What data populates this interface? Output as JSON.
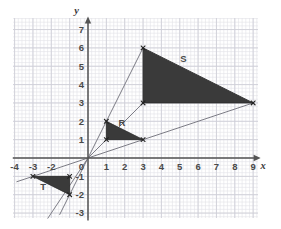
{
  "figure": {
    "background_color": "#ffffff",
    "grid_minor_color": "#e3e3e8",
    "grid_major_color": "#cfcfd8",
    "axis_color": "#555555",
    "ray_color": "#6e6e78",
    "shape_fill": "#3a3a3a",
    "shape_stroke": "#2b2b2b",
    "label_color": "#4a4a4a"
  },
  "grid": {
    "origin_px": {
      "x": 88.0,
      "y": 158.0
    },
    "unit_px": 18.35,
    "minor_per_unit": 5,
    "extent_px": {
      "left": 13,
      "top": 18,
      "right": 258,
      "bottom": 218
    },
    "show_minor": true,
    "show_major": true
  },
  "axes": {
    "x_axis": {
      "name": "x",
      "name_pos": {
        "x": 9.55,
        "y": -0.62
      },
      "ticks": [
        -4,
        -3,
        -2,
        1,
        2,
        3,
        4,
        5,
        6,
        7,
        8,
        9
      ],
      "tick_labels": [
        "-4",
        "-3",
        "-2",
        "1",
        "2",
        "3",
        "4",
        "5",
        "6",
        "7",
        "8",
        "9"
      ],
      "range": [
        -4.1,
        9.3
      ]
    },
    "y_axis": {
      "name": "y",
      "name_pos": {
        "x": -0.62,
        "y": 7.85
      },
      "ticks": [
        -3,
        -2,
        -1,
        1,
        2,
        3,
        4,
        5,
        6,
        7
      ],
      "tick_labels": [
        "-3",
        "-2",
        "-1",
        "1",
        "2",
        "3",
        "4",
        "5",
        "6",
        "7"
      ],
      "range": [
        -3.4,
        7.6
      ]
    },
    "origin_label": "0"
  },
  "chart_data": {
    "type": "diagram",
    "xlabel": "x",
    "ylabel": "y",
    "xlim": [
      -4.1,
      9.3
    ],
    "ylim": [
      -3.4,
      7.6
    ],
    "grid": true,
    "shapes": [
      {
        "name": "R",
        "label": "R",
        "label_pos": {
          "x": 1.85,
          "y": 1.72
        },
        "vertices": [
          {
            "x": 1,
            "y": 2
          },
          {
            "x": 1,
            "y": 1
          },
          {
            "x": 3,
            "y": 1
          }
        ],
        "fill": "#3a3a3a",
        "marked_vertices": true
      },
      {
        "name": "S",
        "label": "S",
        "label_pos": {
          "x": 5.2,
          "y": 5.25
        },
        "vertices": [
          {
            "x": 3,
            "y": 6
          },
          {
            "x": 3,
            "y": 3
          },
          {
            "x": 9,
            "y": 3
          }
        ],
        "fill": "#3a3a3a",
        "marked_vertices": true
      },
      {
        "name": "T",
        "label": "T",
        "label_pos": {
          "x": -2.45,
          "y": -1.72
        },
        "vertices": [
          {
            "x": -3,
            "y": -1
          },
          {
            "x": -1,
            "y": -1
          },
          {
            "x": -1,
            "y": -2
          }
        ],
        "fill": "#3a3a3a",
        "marked_vertices": true
      }
    ],
    "rays": [
      {
        "name": "ray-to-S-top",
        "from": {
          "x": 0,
          "y": 0
        },
        "to": {
          "x": 3,
          "y": 6
        }
      },
      {
        "name": "ray-to-S-left",
        "from": {
          "x": 0,
          "y": 0
        },
        "to": {
          "x": 3,
          "y": 3
        }
      },
      {
        "name": "ray-to-S-right",
        "from": {
          "x": 0,
          "y": 0
        },
        "to": {
          "x": 9,
          "y": 3
        }
      },
      {
        "name": "ray-to-T-left",
        "from": {
          "x": 0,
          "y": 0
        },
        "to": {
          "x": -3.9,
          "y": -1.3
        }
      },
      {
        "name": "ray-to-T-mid",
        "from": {
          "x": 0,
          "y": 0
        },
        "to": {
          "x": -2.2,
          "y": -3.3
        }
      },
      {
        "name": "ray-to-T-bottom",
        "from": {
          "x": 0,
          "y": 0
        },
        "to": {
          "x": -1.55,
          "y": -3.1
        }
      }
    ],
    "vertex_markers": [
      {
        "x": 1,
        "y": 2
      },
      {
        "x": 1,
        "y": 1
      },
      {
        "x": 3,
        "y": 1
      },
      {
        "x": 3,
        "y": 6
      },
      {
        "x": 3,
        "y": 3
      },
      {
        "x": 9,
        "y": 3
      },
      {
        "x": -3,
        "y": -1
      },
      {
        "x": -1,
        "y": -1
      },
      {
        "x": -1,
        "y": -2
      }
    ]
  }
}
